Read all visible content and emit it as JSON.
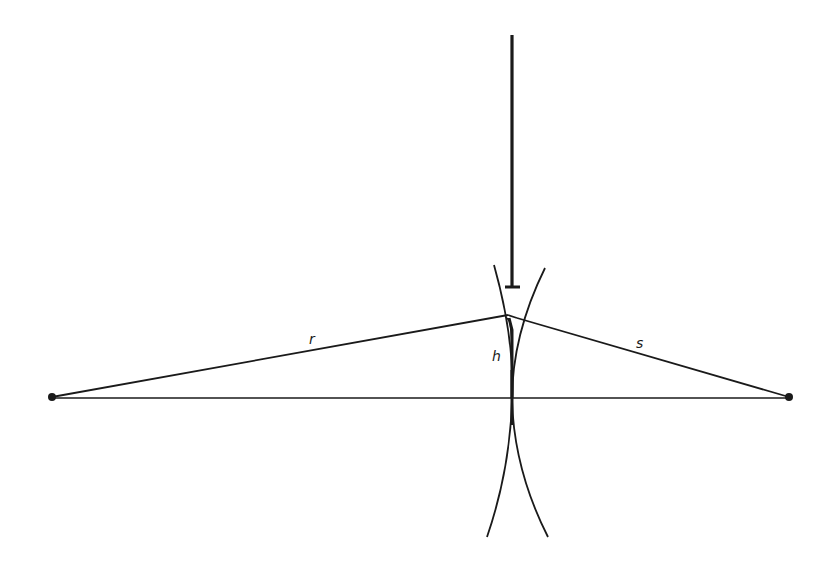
{
  "diagram": {
    "type": "geometric-construction",
    "colors": {
      "stroke": "#1a1a1a",
      "background": "#ffffff"
    },
    "labels": {
      "r": "r",
      "s": "s",
      "h": "h"
    },
    "points": {
      "left_end": [
        52,
        397
      ],
      "right_end": [
        789,
        397
      ],
      "apex": [
        508,
        315
      ]
    },
    "rod": {
      "x": 512,
      "y_top": 35,
      "y_bottom": 287,
      "cap_half_width": 7
    },
    "label_positions": {
      "r": [
        309,
        332
      ],
      "s": [
        636,
        336
      ],
      "h": [
        492,
        349
      ]
    }
  }
}
